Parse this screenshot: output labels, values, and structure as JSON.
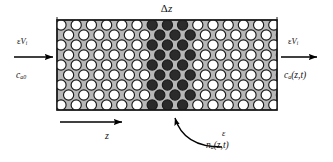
{
  "figure": {
    "type": "packed-bed-schematic",
    "background_color": "#ffffff",
    "bed_fill_color": "#b8b8b8",
    "bed_border_color": "#1a1a1a",
    "pellet_light_color": "#ffffff",
    "pellet_dark_color": "#2b2b2b",
    "pellet_outline_color": "#1a1a1a",
    "arrow_color": "#000000",
    "bed_rect": {
      "x": 57,
      "y": 20,
      "width": 220,
      "height": 90
    },
    "dark_band": {
      "x_start": 152,
      "x_end": 196
    },
    "pellet_grid": {
      "rows": 9,
      "cols": 14,
      "radius_px": 5.1,
      "stagger": true
    }
  },
  "labels": {
    "slice_thickness": {
      "text": "Δz",
      "greek": "Δ",
      "italic_var": "z",
      "name": "delta-z"
    },
    "inlet_flux": {
      "greek": "ε",
      "italic_var": "V",
      "subscript": "i",
      "full_text": "εVi"
    },
    "inlet_concentration": {
      "italic_var": "c",
      "subscript": "a0",
      "full_text": "ca0"
    },
    "outlet_flux": {
      "greek": "ε",
      "italic_var": "V",
      "subscript": "i",
      "full_text": "εVi"
    },
    "outlet_concentration": {
      "italic_var": "c",
      "subscript": "a",
      "argument": "(z,t)",
      "full_text": "ca(z,t)"
    },
    "axis_direction": {
      "italic_var": "z",
      "full_text": "z"
    },
    "porosity": {
      "greek": "ε",
      "full_text": "ε"
    },
    "solid_loading": {
      "italic_var": "n",
      "subscript": "a",
      "argument": "(z,t)",
      "full_text": "na(z,t)"
    }
  },
  "arrows": {
    "inlet": {
      "name": "inlet-flow-arrow",
      "x1": 14,
      "y1": 57,
      "x2": 57,
      "y2": 57
    },
    "outlet": {
      "name": "outlet-flow-arrow",
      "x1": 277,
      "y1": 57,
      "x2": 321,
      "y2": 57
    },
    "axis": {
      "name": "z-axis-arrow",
      "x1": 60,
      "y1": 122,
      "x2": 126,
      "y2": 122
    },
    "callout": {
      "name": "slice-callout-arrow",
      "from_x": 222,
      "from_y": 147,
      "to_x": 174,
      "to_y": 112
    }
  }
}
